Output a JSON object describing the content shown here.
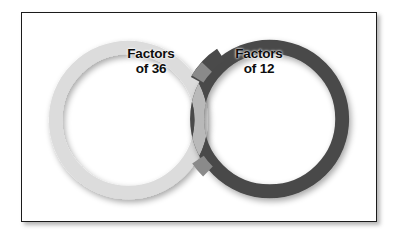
{
  "figure": {
    "type": "venn-diagram",
    "title": "",
    "background_color": "#ffffff",
    "frame": {
      "border_color": "#1b1b1b",
      "fill_color": "#ffffff",
      "has_drop_shadow": true
    }
  },
  "sets": [
    {
      "id": "left",
      "label_line1": "Factors",
      "label_line2": "of 36",
      "ring_color": "#dcdcdc",
      "ring_color_shaded": "#c9c9c9",
      "center_x": 128,
      "center_y": 119,
      "radius": 80,
      "ring_width": 13
    },
    {
      "id": "right",
      "label_line1": "Factors",
      "label_line2": "of 12",
      "ring_color": "#4a4a4a",
      "ring_color_shaded": "#3a3a3a",
      "center_x": 270,
      "center_y": 118,
      "radius": 80,
      "ring_width": 14
    }
  ],
  "intersection": {
    "color": "#8a8a8a",
    "description": "overlapping ring segments where the two circles cross"
  }
}
